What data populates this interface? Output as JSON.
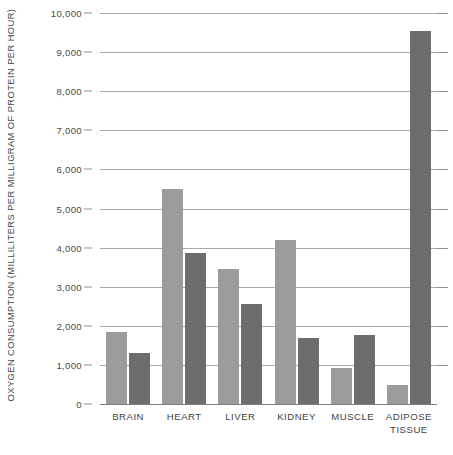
{
  "chart_data": {
    "type": "bar",
    "title": "",
    "subtitle": "",
    "xlabel": "",
    "ylabel": "OXYGEN CONSUMPTION (MILLILITERS PER MILLIGRAM OF PROTEIN PER HOUR)",
    "ylim": [
      0,
      10000
    ],
    "ytick_labels": [
      "10,000",
      "9,000",
      "8,000",
      "7,000",
      "6,000",
      "5,000",
      "4,000",
      "3,000",
      "2,000",
      "1,000",
      "0"
    ],
    "ytick_values": [
      10000,
      9000,
      8000,
      7000,
      6000,
      5000,
      4000,
      3000,
      2000,
      1000,
      0
    ],
    "grid": true,
    "legend": "none",
    "categories": [
      "BRAIN",
      "HEART",
      "LIVER",
      "KIDNEY",
      "MUSCLE",
      "ADIPOSE TISSUE"
    ],
    "category_lines": [
      [
        "BRAIN"
      ],
      [
        "HEART"
      ],
      [
        "LIVER"
      ],
      [
        "KIDNEY"
      ],
      [
        "MUSCLE"
      ],
      [
        "ADIPOSE",
        "TISSUE"
      ]
    ],
    "series": [
      {
        "name": "series-a",
        "color": "#9c9c9c",
        "values": [
          1840,
          5500,
          3450,
          4200,
          930,
          480
        ]
      },
      {
        "name": "series-b",
        "color": "#6d6d6d",
        "values": [
          1300,
          3850,
          2560,
          1680,
          1760,
          9550
        ]
      }
    ]
  },
  "colors": {
    "series_a": "#9c9c9c",
    "series_b": "#6d6d6d",
    "gridline": "#a9a9a9",
    "axis": "#7d7d7d",
    "text": "#3f3f3f",
    "background": "#ffffff"
  }
}
